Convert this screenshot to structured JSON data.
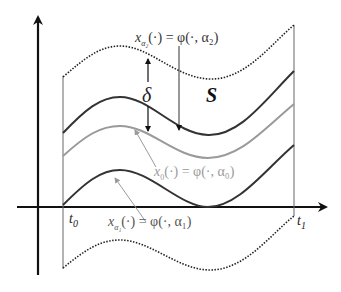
{
  "diagram": {
    "type": "tube of trajectories around nominal solution",
    "labels": {
      "alpha2": {
        "lhs": "x",
        "sub": "α₂",
        "rhs": "(·) = φ(·, α₂)"
      },
      "alpha0": {
        "lhs": "x",
        "sub": "0",
        "rhs": "(·) = φ(·, α₀)"
      },
      "alpha1": {
        "lhs": "x",
        "sub": "α₁",
        "rhs": "(·) = φ(·, α₁)"
      },
      "delta": "δ",
      "set": "S",
      "t0": "t",
      "t0_sub": "0",
      "t1": "t",
      "t1_sub": "1"
    },
    "curves": [
      {
        "name": "upper-tube-boundary",
        "style": "dotted",
        "color": "#222222"
      },
      {
        "name": "trajectory-alpha2",
        "style": "solid",
        "color": "#333333"
      },
      {
        "name": "trajectory-alpha0",
        "style": "solid",
        "color": "#9a9a9a"
      },
      {
        "name": "trajectory-alpha1",
        "style": "solid",
        "color": "#333333"
      },
      {
        "name": "lower-tube-boundary",
        "style": "dotted",
        "color": "#222222"
      }
    ],
    "colors": {
      "axis": "#111111",
      "dark_curve": "#333333",
      "gray_curve": "#9a9a9a",
      "boundary_line": "#666666"
    }
  }
}
